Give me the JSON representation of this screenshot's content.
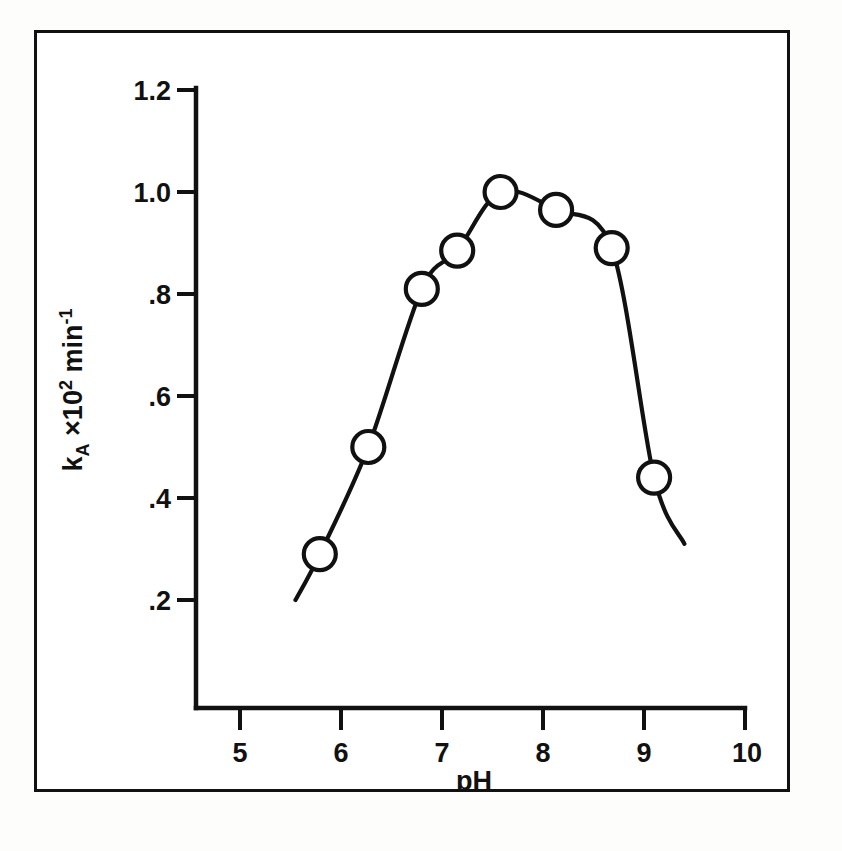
{
  "figure": {
    "background_color": "#ffffff",
    "ink_color": "#111111",
    "has_outer_border": true
  },
  "chart_data": {
    "type": "line",
    "title": "",
    "subtitle": "",
    "xlabel": "pH",
    "ylabel": "k_A x10^2 min^-1",
    "ylabel_parts": {
      "symbol": "k",
      "subscript": "A",
      "multiplier": "×10",
      "multiplier_exponent": "2",
      "unit": "min",
      "unit_exponent": "-1"
    },
    "xlim": [
      5,
      10
    ],
    "ylim": [
      0,
      1.2
    ],
    "xticks": [
      5,
      6,
      7,
      8,
      9,
      10
    ],
    "xtick_labels": [
      "5",
      "6",
      "7",
      "8",
      "9",
      "10"
    ],
    "yticks": [
      0.2,
      0.4,
      0.6,
      0.8,
      1.0,
      1.2
    ],
    "ytick_labels": [
      ".2",
      ".4",
      ".6",
      ".8",
      "1.0",
      "1.2"
    ],
    "grid": false,
    "legend": null,
    "marker": "open-circle",
    "series": [
      {
        "name": "k_A vs pH",
        "x": [
          5.79,
          6.27,
          6.8,
          7.15,
          7.58,
          8.13,
          8.68,
          9.1
        ],
        "values": [
          0.29,
          0.5,
          0.81,
          0.885,
          1.0,
          0.965,
          0.89,
          0.44
        ]
      }
    ],
    "curve_extends_beyond_markers": true,
    "curve_start_x": 5.55,
    "curve_start_y": 0.2,
    "curve_end_x": 9.4,
    "curve_end_y": 0.31
  }
}
